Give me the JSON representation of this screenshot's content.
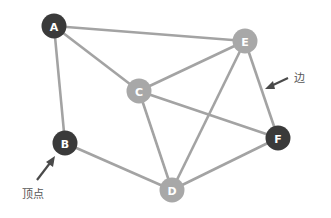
{
  "diagram": {
    "type": "graph",
    "colors": {
      "edge": "#a3a3a3",
      "dark_node": "#3a3a3a",
      "light_node": "#a8a8a8",
      "label": "#ffffff",
      "arrow": "#4a4a4a",
      "annotation_text": "#555555"
    },
    "nodes": [
      {
        "id": "A",
        "label": "A",
        "x": 54,
        "y": 26,
        "style": "dark"
      },
      {
        "id": "B",
        "label": "B",
        "x": 65,
        "y": 143,
        "style": "dark"
      },
      {
        "id": "C",
        "label": "C",
        "x": 139,
        "y": 91,
        "style": "light"
      },
      {
        "id": "D",
        "label": "D",
        "x": 172,
        "y": 190,
        "style": "light"
      },
      {
        "id": "E",
        "label": "E",
        "x": 245,
        "y": 41,
        "style": "light"
      },
      {
        "id": "F",
        "label": "F",
        "x": 278,
        "y": 138,
        "style": "dark"
      }
    ],
    "edges": [
      [
        "A",
        "E"
      ],
      [
        "A",
        "C"
      ],
      [
        "A",
        "B"
      ],
      [
        "B",
        "D"
      ],
      [
        "C",
        "E"
      ],
      [
        "C",
        "F"
      ],
      [
        "C",
        "D"
      ],
      [
        "E",
        "D"
      ],
      [
        "E",
        "F"
      ],
      [
        "D",
        "F"
      ]
    ],
    "annotations": {
      "vertex_label": "顶点",
      "edge_label": "边"
    }
  }
}
